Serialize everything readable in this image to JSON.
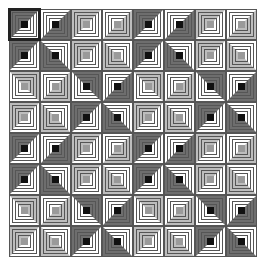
{
  "game": {
    "name": "log-cabin-quilt-puzzle",
    "grid": {
      "rows": 8,
      "cols": 8,
      "tile_size": 31,
      "origin_x": 9,
      "origin_y": 9
    },
    "selected": {
      "row": 0,
      "col": 0
    },
    "colors": {
      "dark_tone": "#6e6e6e",
      "dark_center": "#111111",
      "light_tone": "#bdbdbd",
      "light_center": "#9a9a9a",
      "paper": "#ffffff",
      "line": "#555555",
      "selection": "#222222"
    },
    "block_pattern": [
      [
        {
          "tone": "dark",
          "side": "TL"
        },
        {
          "tone": "dark",
          "side": "BR"
        },
        {
          "tone": "light",
          "side": "TL"
        },
        {
          "tone": "light",
          "side": "BR"
        }
      ],
      [
        {
          "tone": "dark",
          "side": "TL"
        },
        {
          "tone": "dark",
          "side": "BL"
        },
        {
          "tone": "light",
          "side": "TL"
        },
        {
          "tone": "light",
          "side": "BL"
        }
      ],
      [
        {
          "tone": "light",
          "side": "TR"
        },
        {
          "tone": "light",
          "side": "BR"
        },
        {
          "tone": "dark",
          "side": "TR"
        },
        {
          "tone": "dark",
          "side": "BR"
        }
      ],
      [
        {
          "tone": "light",
          "side": "TL"
        },
        {
          "tone": "light",
          "side": "BL"
        },
        {
          "tone": "dark",
          "side": "TL"
        },
        {
          "tone": "dark",
          "side": "BL"
        }
      ]
    ]
  }
}
